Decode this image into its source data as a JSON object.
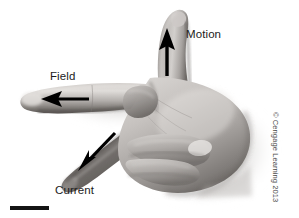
{
  "figure": {
    "background_color": "#ffffff",
    "width": 299,
    "height": 218
  },
  "labels": {
    "motion": "Motion",
    "field": "Field",
    "current": "Current"
  },
  "copyright": {
    "text": "© Cengage Learning 2013",
    "color": "#4a4a4a"
  },
  "scale_bar": {
    "color": "#141414"
  },
  "arrows": {
    "motion": {
      "name": "motion-arrow",
      "direction": "up",
      "color": "#000000",
      "points_to_label": "Motion"
    },
    "field": {
      "name": "field-arrow",
      "direction": "left",
      "color": "#000000",
      "points_to_label": "Field"
    },
    "current": {
      "name": "current-arrow",
      "direction": "down-left",
      "color": "#000000",
      "points_to_label": "Current"
    }
  },
  "hand": {
    "description": "Grayscale photograph of a right hand with thumb up, index finger pointing left, middle finger pointing down-left",
    "skin_light": "#e3e0dd",
    "skin_mid": "#a9a5a2",
    "skin_dark": "#5f5b58",
    "shadow": "#cfcccb"
  }
}
